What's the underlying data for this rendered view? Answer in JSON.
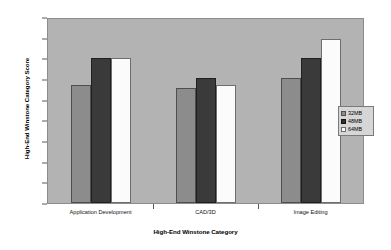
{
  "chart_data": {
    "type": "bar",
    "title": "",
    "subtitle": "",
    "xlabel": "High-End Winstone Category",
    "ylabel": "High-End Winstone Category Score",
    "categories": [
      "Application Development",
      "CAD/3D",
      "Image Editing"
    ],
    "series": [
      {
        "name": "32MB",
        "values": [
          1.15,
          1.13,
          1.22
        ],
        "color": "#8c8c8c"
      },
      {
        "name": "48MB",
        "values": [
          1.42,
          1.22,
          1.42
        ],
        "color": "#3a3a3a"
      },
      {
        "name": "64MB",
        "values": [
          1.42,
          1.15,
          1.6
        ],
        "color": "#fbfbfb"
      }
    ],
    "ylim": [
      0,
      1.8
    ],
    "ytick_step": 0.2,
    "yticks": [
      "0",
      "0.2",
      "0.4",
      "0.6",
      "0.8",
      "1",
      "1.2",
      "1.4",
      "1.6",
      "1.8"
    ],
    "ytick_values": [
      0,
      0.2,
      0.4,
      0.6,
      0.8,
      1.0,
      1.2,
      1.4,
      1.6,
      1.8
    ],
    "grid": false,
    "legend_position": "right",
    "plot_background": "#b3b3b3",
    "figure_background": "#ffffff"
  },
  "legend": {
    "items": [
      {
        "label": "32MB"
      },
      {
        "label": "48MB"
      },
      {
        "label": "64MB"
      }
    ]
  }
}
